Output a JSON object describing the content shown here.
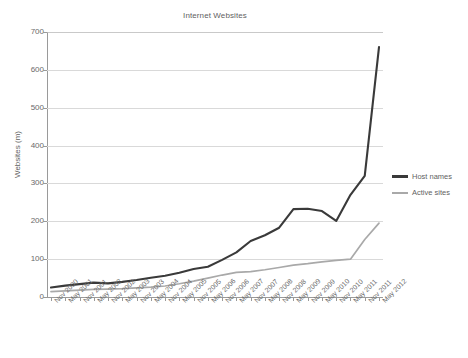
{
  "chart_data": {
    "type": "line",
    "title": "Internet Websites",
    "xlabel": "",
    "ylabel": "Websites (m)",
    "ylim": [
      0,
      700
    ],
    "ytick_values": [
      0,
      100,
      200,
      300,
      400,
      500,
      600,
      700
    ],
    "ytick_labels": [
      "0",
      "100",
      "200",
      "300",
      "400",
      "500",
      "600",
      "700"
    ],
    "grid": true,
    "legend_position": "right",
    "categories": [
      "Nov 2000",
      "May 2001",
      "Nov 2001",
      "May 2002",
      "Nov 2002",
      "May 2003",
      "Nov 2003",
      "May 2004",
      "Nov 2004",
      "May 2005",
      "Nov 2005",
      "May 2006",
      "Nov 2006",
      "May 2007",
      "Nov 2007",
      "May 2008",
      "Nov 2008",
      "May 2009",
      "Nov 2009",
      "May 2010",
      "Nov 2010",
      "May 2011",
      "Nov 2011",
      "May 2012"
    ],
    "series": [
      {
        "name": "Host names",
        "color": "#3a3a3a",
        "values": [
          25,
          30,
          34,
          38,
          36,
          40,
          45,
          51,
          56,
          64,
          74,
          80,
          98,
          118,
          148,
          163,
          183,
          232,
          233,
          227,
          201,
          270,
          320,
          660
        ]
      },
      {
        "name": "Active sites",
        "color": "#a9a9a9",
        "values": [
          14,
          16,
          18,
          20,
          21,
          22,
          24,
          26,
          29,
          35,
          42,
          50,
          58,
          65,
          67,
          72,
          78,
          84,
          88,
          93,
          97,
          100,
          152,
          195
        ]
      }
    ]
  },
  "legend": {
    "items": [
      {
        "label": "Host names"
      },
      {
        "label": "Active sites"
      }
    ]
  }
}
